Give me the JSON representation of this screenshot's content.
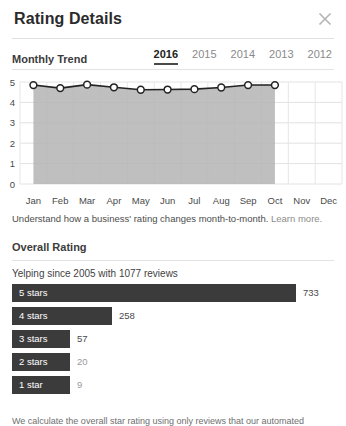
{
  "header": {
    "title": "Rating Details",
    "close_icon": "close-icon"
  },
  "monthly_trend": {
    "label": "Monthly Trend",
    "years": [
      {
        "label": "2016",
        "active": true
      },
      {
        "label": "2015",
        "active": false
      },
      {
        "label": "2014",
        "active": false
      },
      {
        "label": "2013",
        "active": false
      },
      {
        "label": "2012",
        "active": false
      }
    ],
    "caption_text": "Understand how a business' rating changes month-to-month.",
    "caption_link": "Learn more."
  },
  "overall_rating": {
    "label": "Overall Rating",
    "since_text": "Yelping since 2005 with 1077 reviews",
    "footnote": "We calculate the overall star rating using only reviews that our automated software"
  },
  "chart_data": [
    {
      "type": "line",
      "title": "Monthly Trend",
      "xlabel": "",
      "ylabel": "",
      "ylim": [
        0,
        5
      ],
      "yticks": [
        0,
        1,
        2,
        3,
        4,
        5
      ],
      "grid": true,
      "legend": "none",
      "fill": true,
      "categories": [
        "Jan",
        "Feb",
        "Mar",
        "Apr",
        "May",
        "Jun",
        "Jul",
        "Aug",
        "Sep",
        "Oct",
        "Nov",
        "Dec"
      ],
      "values": [
        4.85,
        4.7,
        4.87,
        4.74,
        4.62,
        4.63,
        4.65,
        4.73,
        4.85,
        4.85,
        null,
        null
      ],
      "line_color": "#222222",
      "fill_color": "#b4b4b4",
      "marker_color": "#ffffff"
    },
    {
      "type": "bar",
      "orientation": "horizontal",
      "title": "Overall Rating",
      "categories": [
        "5 stars",
        "4 stars",
        "3 stars",
        "2 stars",
        "1 star"
      ],
      "values": [
        733,
        258,
        57,
        20,
        9
      ],
      "xlim": [
        0,
        733
      ],
      "bar_color": "#3b3b3b",
      "grid": false,
      "legend": "none"
    }
  ]
}
